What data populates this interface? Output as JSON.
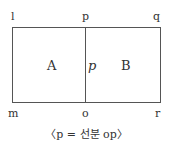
{
  "points": {
    "l": "l",
    "p": "p",
    "q": "q",
    "m": "m",
    "o": "o",
    "r": "r"
  },
  "regions": {
    "a": "A",
    "b": "B",
    "p": "p"
  },
  "caption": "〈p = 선분 op〉"
}
